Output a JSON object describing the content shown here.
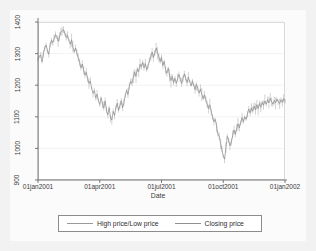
{
  "chart_data": {
    "type": "line",
    "title": "",
    "xlabel": "Date",
    "ylabel": "",
    "xlim": [
      "01jan2001",
      "01jan2002"
    ],
    "ylim": [
      900,
      1400
    ],
    "grid": true,
    "grid_axis": "y",
    "legend_position": "bottom",
    "y_ticks": [
      900,
      1000,
      1100,
      1200,
      1300,
      1400
    ],
    "x_ticks": [
      "01jan2001",
      "01apr2001",
      "01jul2001",
      "01oct2001",
      "01jan2002"
    ],
    "series": [
      {
        "name": "High price/Low price",
        "color": "#9a9a9a",
        "type": "range-band",
        "note": "vertical high-low range drawn behind closing line"
      },
      {
        "name": "Closing price",
        "color": "#8a8a8a",
        "type": "line",
        "values": [
          1283,
          1291,
          1296,
          1274,
          1301,
          1318,
          1327,
          1310,
          1298,
          1327,
          1342,
          1334,
          1348,
          1360,
          1354,
          1339,
          1352,
          1366,
          1373,
          1375,
          1364,
          1351,
          1358,
          1342,
          1330,
          1344,
          1320,
          1306,
          1318,
          1301,
          1286,
          1273,
          1255,
          1267,
          1248,
          1232,
          1241,
          1220,
          1205,
          1213,
          1190,
          1174,
          1183,
          1160,
          1172,
          1151,
          1139,
          1160,
          1142,
          1128,
          1150,
          1122,
          1106,
          1128,
          1096,
          1090,
          1117,
          1104,
          1128,
          1143,
          1120,
          1135,
          1151,
          1128,
          1145,
          1168,
          1183,
          1170,
          1196,
          1212,
          1206,
          1224,
          1241,
          1228,
          1252,
          1243,
          1266,
          1258,
          1272,
          1255,
          1268,
          1248,
          1262,
          1278,
          1290,
          1305,
          1288,
          1303,
          1318,
          1304,
          1290,
          1275,
          1288,
          1262,
          1275,
          1250,
          1238,
          1254,
          1230,
          1215,
          1228,
          1208,
          1222,
          1206,
          1220,
          1234,
          1218,
          1205,
          1221,
          1236,
          1222,
          1208,
          1226,
          1212,
          1198,
          1214,
          1200,
          1186,
          1203,
          1190,
          1175,
          1188,
          1172,
          1158,
          1170,
          1154,
          1140,
          1126,
          1138,
          1118,
          1100,
          1084,
          1092,
          1072,
          1046,
          1038,
          1016,
          996,
          976,
          966,
          1003,
          1038,
          1026,
          1008,
          1020,
          1040,
          1058,
          1044,
          1062,
          1078,
          1065,
          1082,
          1098,
          1084,
          1100,
          1092,
          1108,
          1124,
          1112,
          1128,
          1118,
          1134,
          1122,
          1138,
          1126,
          1142,
          1130,
          1146,
          1136,
          1150,
          1140,
          1154,
          1144,
          1158,
          1148,
          1140,
          1152,
          1144,
          1156,
          1148,
          1142,
          1154,
          1146,
          1158,
          1150
        ]
      }
    ]
  },
  "axis": {
    "y_labels": [
      "1400",
      "1300",
      "1200",
      "1100",
      "1000",
      "900"
    ],
    "x_labels": [
      "01jan2001",
      "01apr2001",
      "01jul2001",
      "01oct2001",
      "01jan2002"
    ],
    "x_title": "Date"
  },
  "legend": {
    "items": [
      {
        "label": "High price/Low price"
      },
      {
        "label": "Closing price"
      }
    ]
  },
  "colors": {
    "background": "#f2f2f2",
    "graph_region": "#fbfbfb",
    "plot_background": "#ffffff",
    "line": "#8a8a8a",
    "grid": "#eaeaea",
    "axis": "#5a5a5a",
    "text": "#3a3a3a"
  }
}
